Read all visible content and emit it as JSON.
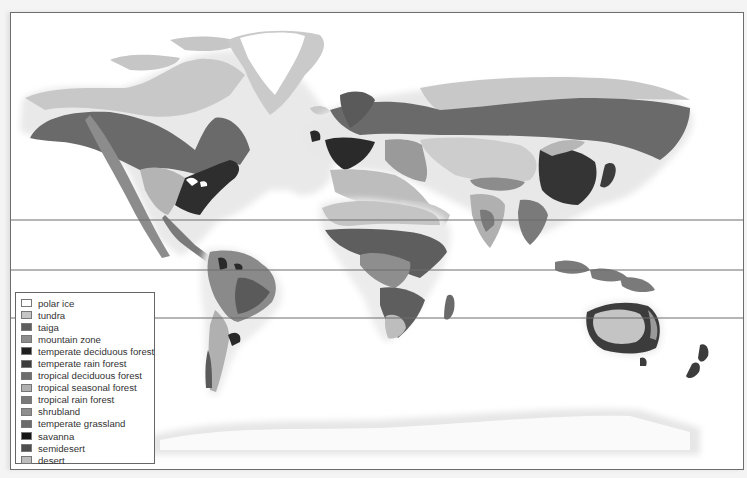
{
  "map": {
    "type": "world biome map",
    "latitude_lines_y": [
      220,
      270,
      318
    ],
    "legend": {
      "items": [
        {
          "label": "polar ice",
          "color": "#ffffff"
        },
        {
          "label": "tundra",
          "color": "#c4c4c4"
        },
        {
          "label": "taiga",
          "color": "#5e5e5e"
        },
        {
          "label": "mountain zone",
          "color": "#8c8c8c"
        },
        {
          "label": "temperate deciduous forest",
          "color": "#1f1f1f"
        },
        {
          "label": "temperate rain forest",
          "color": "#3c3c3c"
        },
        {
          "label": "tropical deciduous forest",
          "color": "#6e6e6e"
        },
        {
          "label": "tropical seasonal forest",
          "color": "#b0b0b0"
        },
        {
          "label": "tropical rain forest",
          "color": "#7a7a7a"
        },
        {
          "label": "shrubland",
          "color": "#8e8e8e"
        },
        {
          "label": "temperate grassland",
          "color": "#6a6a6a"
        },
        {
          "label": "savanna",
          "color": "#151515"
        },
        {
          "label": "semidesert",
          "color": "#4e4e4e"
        },
        {
          "label": "desert",
          "color": "#bdbdbd"
        }
      ]
    }
  }
}
